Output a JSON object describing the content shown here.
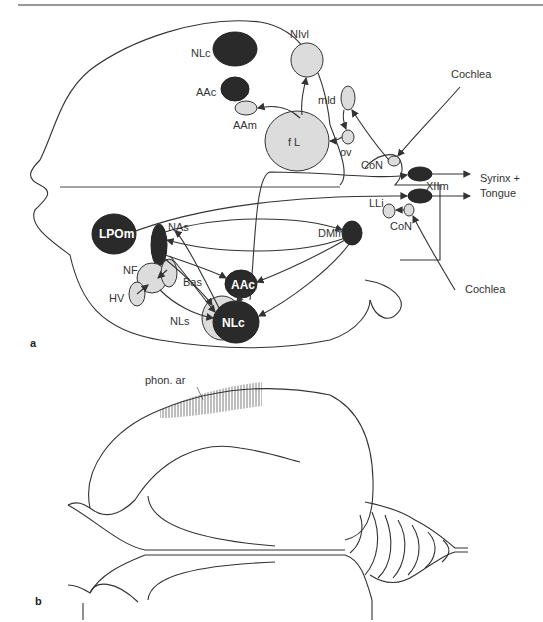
{
  "figure": {
    "panel_a_label": "a",
    "panel_b_label": "b"
  },
  "panel_a": {
    "nuclei": {
      "NLc_top": "NLc",
      "NIvl": "NIvl",
      "AAc_top": "AAc",
      "AAm": "AAm",
      "mld": "mld",
      "fL": "f L",
      "ov": "ov",
      "CoN_top": "CoN",
      "XIIm": "XIIm",
      "LLi": "LLi",
      "CoN_bottom": "CoN",
      "LPOm": "LPOm",
      "NAs": "NAs",
      "DMm": "DMm",
      "NF": "NF",
      "Bas": "Bas",
      "HV": "HV",
      "AAc_bottom": "AAc",
      "NLs": "NLs",
      "NLc_bottom": "NLc"
    },
    "external": {
      "cochlea_top": "Cochlea",
      "cochlea_bottom": "Cochlea",
      "output_line1": "Syrinx +",
      "output_line2": "Tongue"
    }
  },
  "panel_b": {
    "annotation": "phon. ar"
  },
  "colors": {
    "dark_nucleus": "#2a2a2a",
    "light_nucleus": "#dcdcdc",
    "line": "#333333"
  }
}
